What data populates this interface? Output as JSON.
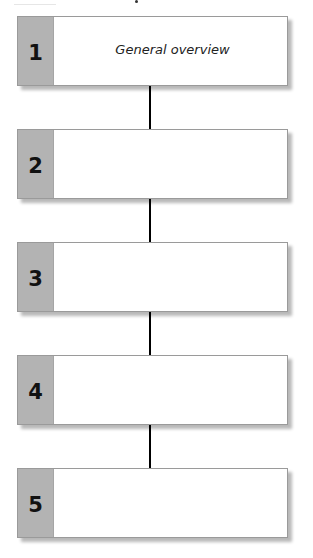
{
  "diagram": {
    "type": "vertical-flow",
    "steps": [
      {
        "number": "1",
        "label": "General overview"
      },
      {
        "number": "2",
        "label": ""
      },
      {
        "number": "3",
        "label": ""
      },
      {
        "number": "4",
        "label": ""
      },
      {
        "number": "5",
        "label": ""
      }
    ],
    "colors": {
      "tab": "#b3b3b3",
      "box_border": "#9a9a9a",
      "connector": "#000000",
      "background": "#ffffff"
    }
  }
}
